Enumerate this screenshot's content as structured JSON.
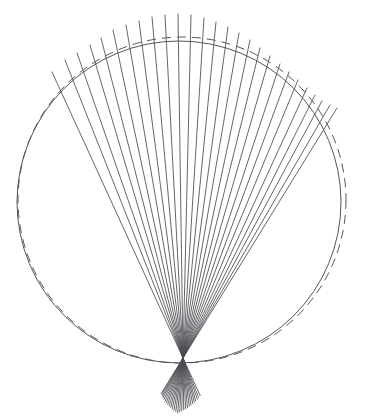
{
  "figure": {
    "canvas": {
      "width": 367,
      "height": 416,
      "background": "#ffffff"
    },
    "colors": {
      "ray_stroke": "#4a4a50",
      "circle_stroke": "#55555c",
      "background": "#ffffff"
    },
    "focus_point": {
      "x": 183,
      "y": 358,
      "label": "convergence-point"
    },
    "solid_circle": {
      "cx": 179,
      "cy": 202,
      "rx": 162,
      "ry": 161,
      "style": "solid",
      "stroke_width": 1.0
    },
    "dashed_circle": {
      "cx": 182,
      "cy": 200,
      "rx": 164,
      "ry": 163,
      "style": "dashed",
      "dash_pattern": "9 6",
      "stroke_width": 1.0
    },
    "rays": {
      "count": 27,
      "stroke_width": 0.85,
      "overshoot_below_focus": 55,
      "description": "Rays emanate from points distributed along the upper arc and all pass through the common focus, extending a short distance beyond it."
    }
  },
  "chart_data": {
    "type": "scatter",
    "xlabel": "",
    "ylabel": "",
    "xlim": [
      0,
      367
    ],
    "ylim": [
      416,
      0
    ],
    "grid": false,
    "legend": null,
    "annotations": [],
    "series": [
      {
        "name": "solid-circle",
        "kind": "circle",
        "center": [
          179,
          202
        ],
        "radius_x": 162,
        "radius_y": 161,
        "linestyle": "solid"
      },
      {
        "name": "dashed-circle",
        "kind": "circle",
        "center": [
          182,
          200
        ],
        "radius_x": 164,
        "radius_y": 163,
        "linestyle": "dashed"
      },
      {
        "name": "rays",
        "kind": "lines",
        "focus": [
          183,
          358
        ],
        "linestyle": "solid",
        "endpoints": [
          [
            52,
            72
          ],
          [
            65,
            60
          ],
          [
            77,
            53
          ],
          [
            90,
            45
          ],
          [
            101,
            38
          ],
          [
            113,
            30
          ],
          [
            126,
            25
          ],
          [
            139,
            21
          ],
          [
            152,
            17
          ],
          [
            165,
            15
          ],
          [
            178,
            14
          ],
          [
            191,
            15
          ],
          [
            204,
            18
          ],
          [
            216,
            22
          ],
          [
            228,
            27
          ],
          [
            239,
            33
          ],
          [
            250,
            40
          ],
          [
            260,
            48
          ],
          [
            270,
            56
          ],
          [
            280,
            64
          ],
          [
            289,
            72
          ],
          [
            298,
            80
          ],
          [
            307,
            88
          ],
          [
            315,
            95
          ],
          [
            322,
            101
          ],
          [
            330,
            105
          ],
          [
            337,
            108
          ]
        ]
      }
    ]
  }
}
